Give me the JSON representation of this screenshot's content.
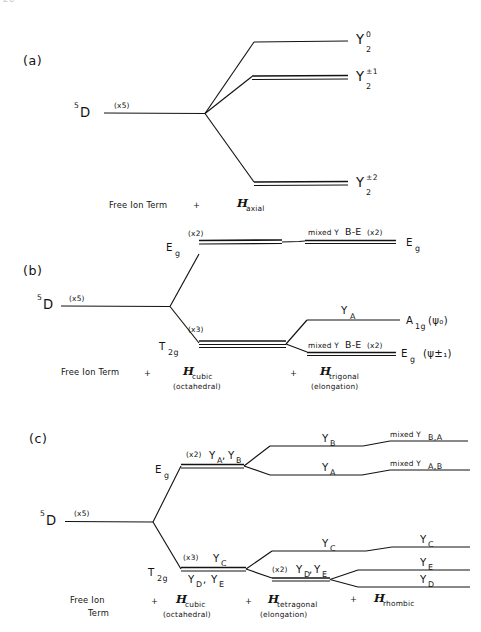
{
  "figure": {
    "page_marker": "28",
    "background_color": "#ffffff",
    "ink_color": "#131313"
  },
  "panels": [
    {
      "id": "a",
      "label": "(a)",
      "free_ion": {
        "term_sup": "5",
        "term": "D",
        "degeneracy": "(x5)"
      },
      "levels": [
        {
          "name": "Y-2-0",
          "label_base": "Y",
          "label_sup": "0",
          "label_sub": "2",
          "degenerate": false
        },
        {
          "name": "Y-2-pm1",
          "label_base": "Y",
          "label_sup": "±1",
          "label_sub": "2",
          "degenerate": true
        },
        {
          "name": "Y-2-pm2",
          "label_base": "Y",
          "label_sup": "±2",
          "label_sub": "2",
          "degenerate": true
        }
      ],
      "footer": [
        {
          "kind": "text",
          "text": "Free Ion Term"
        },
        {
          "kind": "plus",
          "text": "+"
        },
        {
          "kind": "hamiltonian",
          "symbol": "H",
          "sub": "axial"
        }
      ]
    },
    {
      "id": "b",
      "label": "(b)",
      "free_ion": {
        "term_sup": "5",
        "term": "D",
        "degeneracy": "(x5)"
      },
      "cubic_levels": [
        {
          "name": "Eg",
          "label": "E",
          "label_sub": "g",
          "degeneracy": "(x2)"
        },
        {
          "name": "T2g",
          "label": "T",
          "label_sub": "2g",
          "degeneracy": "(x3)"
        }
      ],
      "trigonal_levels": [
        {
          "name": "eg-upper",
          "over_line": "mixed Y",
          "over_sub": "B-E",
          "over_tail": "(x2)",
          "right": "E",
          "right_sub": "g",
          "right_paren": ""
        },
        {
          "name": "a1g",
          "over_line": "Y",
          "over_sub": "A",
          "over_tail": "",
          "right": "A",
          "right_sub": "1g",
          "right_paren": "(ψ₀)"
        },
        {
          "name": "eg-lower",
          "over_line": "mixed Y",
          "over_sub": "B-E",
          "over_tail": "(x2)",
          "right": "E",
          "right_sub": "g",
          "right_paren": "(ψ±₁)"
        }
      ],
      "footer": [
        {
          "kind": "text",
          "text": "Free Ion Term"
        },
        {
          "kind": "plus",
          "text": "+"
        },
        {
          "kind": "hamiltonian",
          "symbol": "H",
          "sub": "cubic",
          "note": "(octahedral)"
        },
        {
          "kind": "plus",
          "text": "+"
        },
        {
          "kind": "hamiltonian",
          "symbol": "H",
          "sub": "trigonal",
          "note": "(elongation)"
        }
      ]
    },
    {
      "id": "c",
      "label": "(c)",
      "free_ion": {
        "term_sup": "5",
        "term": "D",
        "degeneracy": "(x5)"
      },
      "cubic_levels": [
        {
          "name": "Eg",
          "label": "E",
          "label_sub": "g",
          "degeneracy": "(x2)",
          "over": "Y",
          "over_sub": "A",
          "over2": "Y",
          "over2_sub": "B"
        },
        {
          "name": "T2g",
          "label": "T",
          "label_sub": "2g",
          "degeneracy": "(x3)",
          "over": "Y",
          "over_sub": "C",
          "under": "Y",
          "under_sub": "D",
          "under2": "Y",
          "under2_sub": "E"
        }
      ],
      "tetragonal_levels": [
        {
          "name": "YB",
          "label": "Y",
          "label_sub": "B"
        },
        {
          "name": "YA",
          "label": "Y",
          "label_sub": "A"
        },
        {
          "name": "YC",
          "label": "Y",
          "label_sub": "C"
        },
        {
          "name": "YDE",
          "degeneracy": "(x2)",
          "label": "Y",
          "label_sub": "D",
          "label2": "Y",
          "label2_sub": "E"
        }
      ],
      "rhombic_levels": [
        {
          "name": "mixed-BA",
          "label": "mixed Y",
          "label_sub": "B,A"
        },
        {
          "name": "mixed-AB",
          "label": "mixed Y",
          "label_sub": "A,B"
        },
        {
          "name": "YC",
          "label": "Y",
          "label_sub": "C"
        },
        {
          "name": "YE",
          "label": "Y",
          "label_sub": "E"
        },
        {
          "name": "YD",
          "label": "Y",
          "label_sub": "D"
        }
      ],
      "footer": [
        {
          "kind": "text",
          "text": "Free Ion",
          "text2": "Term"
        },
        {
          "kind": "plus",
          "text": "+"
        },
        {
          "kind": "hamiltonian",
          "symbol": "H",
          "sub": "cubic",
          "note": "(octahedral)"
        },
        {
          "kind": "plus",
          "text": "+"
        },
        {
          "kind": "hamiltonian",
          "symbol": "H",
          "sub": "tetragonal",
          "note": "(elongation)"
        },
        {
          "kind": "plus",
          "text": "+"
        },
        {
          "kind": "hamiltonian",
          "symbol": "H",
          "sub": "rhombic",
          "note": ""
        }
      ]
    }
  ]
}
